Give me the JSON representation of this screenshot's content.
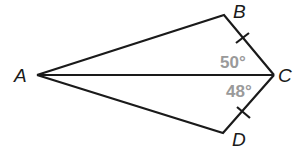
{
  "diagram": {
    "type": "kite-quadrilateral",
    "stroke_color": "#1a1a1a",
    "angle_label_color": "#9a9a9a",
    "vertices": {
      "A": {
        "label": "A",
        "x": 37,
        "y": 75
      },
      "B": {
        "label": "B",
        "x": 224,
        "y": 15
      },
      "C": {
        "label": "C",
        "x": 274,
        "y": 75
      },
      "D": {
        "label": "D",
        "x": 223,
        "y": 133
      }
    },
    "segments": [
      "AB",
      "BC",
      "CD",
      "DA",
      "AC"
    ],
    "congruence_marks": [
      "BC",
      "CD"
    ],
    "angles": [
      {
        "name": "angle-BCA",
        "label": "50°"
      },
      {
        "name": "angle-ACD",
        "label": "48°"
      }
    ]
  }
}
